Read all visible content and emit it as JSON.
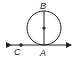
{
  "diagram": {
    "type": "geometry",
    "points": {
      "A": {
        "label": "A"
      },
      "B": {
        "label": "B"
      },
      "C": {
        "label": "C"
      }
    },
    "elements": [
      "circle",
      "tangent-line (double arrow)",
      "diameter AB",
      "center point"
    ],
    "colors": {
      "stroke": "#222222",
      "background": "#ffffff"
    }
  }
}
